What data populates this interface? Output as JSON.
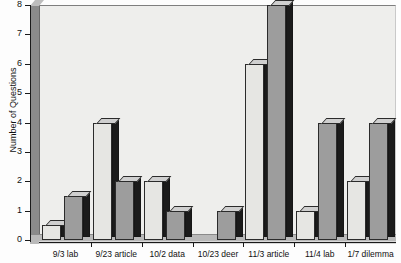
{
  "chart_data": {
    "type": "bar",
    "title": "",
    "subtitle": "",
    "xlabel": "",
    "ylabel": "Number of Questions",
    "ylim": [
      0,
      8
    ],
    "ytick_labels": [
      "0",
      "1",
      "2",
      "3",
      "4",
      "5",
      "6",
      "7",
      "8"
    ],
    "grid": false,
    "legend": "none",
    "categories": [
      "9/3 lab",
      "9/23 article",
      "10/2 data",
      "10/23 deer",
      "11/3 article",
      "11/4 lab",
      "1/7 dilemma"
    ],
    "series": [
      {
        "name": "light",
        "color": "#e6e6e3",
        "values": [
          0.5,
          4,
          2,
          0,
          6,
          1,
          2
        ]
      },
      {
        "name": "dark",
        "color": "#9d9d9d",
        "values": [
          1.5,
          2,
          1,
          1,
          8,
          4,
          4
        ]
      }
    ]
  },
  "axis": {
    "y_title": "Number of Questions"
  },
  "colors": {
    "light_bar": "#e6e6e3",
    "dark_bar": "#9d9d9d",
    "panel": "#eeeeec",
    "axis": "#1a1a1a"
  }
}
